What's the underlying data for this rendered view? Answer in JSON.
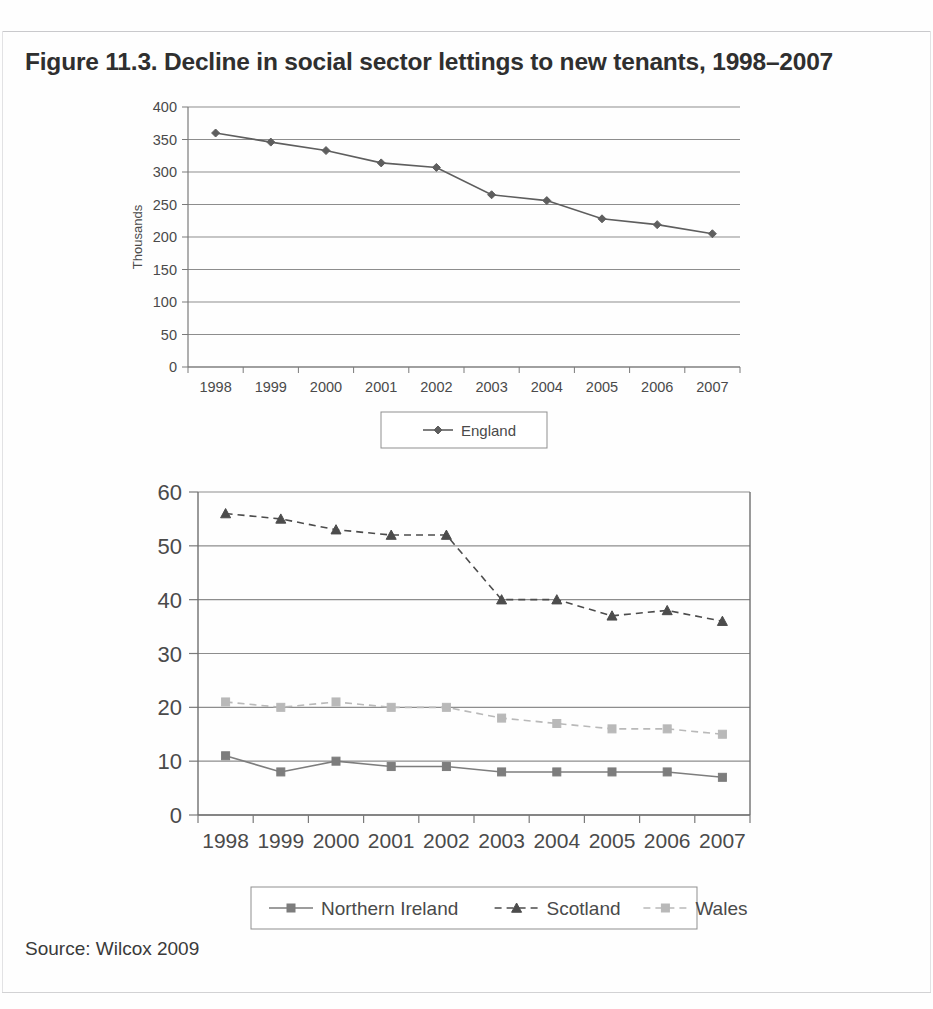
{
  "figure": {
    "title": "Figure 11.3. Decline in social sector lettings to new tenants, 1998–2007",
    "source": "Source: Wilcox 2009"
  },
  "colors": {
    "axis": "#7a7a7a",
    "grid": "#8d8d8d",
    "frame": "#6f6f6f",
    "text": "#4a4a4a",
    "england": "#5e5e5e",
    "northern_ireland": "#7d7d7d",
    "scotland": "#4c4c4c",
    "wales": "#b9b9b9",
    "legend_border": "#8f8f8f"
  },
  "chart_data": [
    {
      "id": "england-chart",
      "type": "line",
      "title": "",
      "xlabel": "",
      "ylabel": "Thousands",
      "categories": [
        "1998",
        "1999",
        "2000",
        "2001",
        "2002",
        "2003",
        "2004",
        "2005",
        "2006",
        "2007"
      ],
      "ylim": [
        0,
        400
      ],
      "yticks": [
        0,
        50,
        100,
        150,
        200,
        250,
        300,
        350,
        400
      ],
      "grid": true,
      "legend_position": "bottom",
      "series": [
        {
          "name": "England",
          "marker": "diamond",
          "linestyle": "solid",
          "color": "#5e5e5e",
          "values": [
            360,
            346,
            333,
            314,
            307,
            265,
            256,
            228,
            219,
            205
          ]
        }
      ]
    },
    {
      "id": "nations-chart",
      "type": "line",
      "title": "",
      "xlabel": "",
      "ylabel": "",
      "categories": [
        "1998",
        "1999",
        "2000",
        "2001",
        "2002",
        "2003",
        "2004",
        "2005",
        "2006",
        "2007"
      ],
      "ylim": [
        0,
        60
      ],
      "yticks": [
        0,
        10,
        20,
        30,
        40,
        50,
        60
      ],
      "grid": true,
      "legend_position": "bottom",
      "series": [
        {
          "name": "Northern Ireland",
          "marker": "square",
          "linestyle": "solid",
          "color": "#7d7d7d",
          "values": [
            11,
            8,
            10,
            9,
            9,
            8,
            8,
            8,
            8,
            7
          ]
        },
        {
          "name": "Scotland",
          "marker": "triangle",
          "linestyle": "dashed",
          "color": "#4c4c4c",
          "values": [
            56,
            55,
            53,
            52,
            52,
            40,
            40,
            37,
            38,
            36
          ]
        },
        {
          "name": "Wales",
          "marker": "square",
          "linestyle": "dashed",
          "color": "#b9b9b9",
          "values": [
            21,
            20,
            21,
            20,
            20,
            18,
            17,
            16,
            16,
            15
          ]
        }
      ]
    }
  ]
}
